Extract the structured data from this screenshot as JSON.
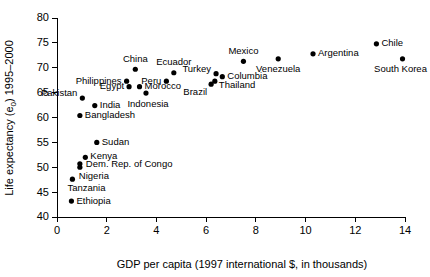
{
  "chart_data": {
    "type": "scatter",
    "title": "",
    "xlabel": "GDP per capita (1997 international $, in thousands)",
    "ylabel": "Life expectancy (e0) 1995–2000",
    "ylabel_main": "Life expectancy (e",
    "ylabel_sub": "0",
    "ylabel_tail": ") 1995–2000",
    "xlim": [
      0,
      14
    ],
    "ylim": [
      40,
      80
    ],
    "xticks": [
      0,
      2,
      4,
      6,
      8,
      10,
      12,
      14
    ],
    "yticks": [
      40,
      45,
      50,
      55,
      60,
      65,
      70,
      75,
      80
    ],
    "grid": false,
    "legend": "none",
    "marker_color": "#000000",
    "axis_color": "#000000",
    "background": "#ffffff",
    "points": [
      {
        "label": "Ethiopia",
        "x": 0.58,
        "y": 43.2,
        "lx": "start",
        "dx": 5,
        "dy": 0
      },
      {
        "label": "Tanzania",
        "x": 0.62,
        "y": 47.6,
        "lx": "start",
        "dx": -5,
        "dy": 9
      },
      {
        "label": "Nigeria",
        "x": 0.92,
        "y": 50.0,
        "lx": "start",
        "dx": -1,
        "dy": 9
      },
      {
        "label": "Dem. Rep. of Congo",
        "x": 0.92,
        "y": 50.7,
        "lx": "start",
        "dx": 6,
        "dy": 1
      },
      {
        "label": "Kenya",
        "x": 1.14,
        "y": 52.0,
        "lx": "start",
        "dx": 5,
        "dy": -0.5
      },
      {
        "label": "Sudan",
        "x": 1.6,
        "y": 55.0,
        "lx": "start",
        "dx": 5,
        "dy": 0
      },
      {
        "label": "Bangladesh",
        "x": 0.92,
        "y": 60.4,
        "lx": "start",
        "dx": 5,
        "dy": 0
      },
      {
        "label": "India",
        "x": 1.52,
        "y": 62.4,
        "lx": "start",
        "dx": 5,
        "dy": 0
      },
      {
        "label": "Pakistan",
        "x": 1.02,
        "y": 63.9,
        "lx": "end",
        "dx": -5,
        "dy": -5
      },
      {
        "label": "Egypt",
        "x": 2.9,
        "y": 66.2,
        "lx": "end",
        "dx": -5,
        "dy": 0
      },
      {
        "label": "Philippines",
        "x": 2.8,
        "y": 67.3,
        "lx": "end",
        "dx": -5,
        "dy": 0
      },
      {
        "label": "China",
        "x": 3.15,
        "y": 69.7,
        "lx": "middle",
        "dx": 0,
        "dy": -10
      },
      {
        "label": "Morocco",
        "x": 3.32,
        "y": 66.2,
        "lx": "start",
        "dx": 5,
        "dy": 0
      },
      {
        "label": "Indonesia",
        "x": 3.58,
        "y": 64.9,
        "lx": "middle",
        "dx": 2,
        "dy": 11
      },
      {
        "label": "Peru",
        "x": 4.4,
        "y": 67.3,
        "lx": "end",
        "dx": -5,
        "dy": 0
      },
      {
        "label": "Ecuador",
        "x": 4.7,
        "y": 69.0,
        "lx": "middle",
        "dx": 0,
        "dy": -10
      },
      {
        "label": "Brazil",
        "x": 6.2,
        "y": 66.7,
        "lx": "end",
        "dx": -4,
        "dy": 8
      },
      {
        "label": "Thailand",
        "x": 6.35,
        "y": 67.3,
        "lx": "start",
        "dx": 4,
        "dy": 4
      },
      {
        "label": "Turkey",
        "x": 6.4,
        "y": 68.8,
        "lx": "end",
        "dx": -5,
        "dy": -4
      },
      {
        "label": "Columbia",
        "x": 6.65,
        "y": 68.2,
        "lx": "start",
        "dx": 5,
        "dy": 0
      },
      {
        "label": "Mexico",
        "x": 7.5,
        "y": 71.3,
        "lx": "middle",
        "dx": 0,
        "dy": -10
      },
      {
        "label": "Venezuela",
        "x": 8.9,
        "y": 71.8,
        "lx": "middle",
        "dx": 0,
        "dy": 11
      },
      {
        "label": "Argentina",
        "x": 10.3,
        "y": 72.8,
        "lx": "start",
        "dx": 5,
        "dy": 0
      },
      {
        "label": "Chile",
        "x": 12.85,
        "y": 74.8,
        "lx": "start",
        "dx": 5,
        "dy": 0
      },
      {
        "label": "South Korea",
        "x": 13.9,
        "y": 71.8,
        "lx": "middle",
        "dx": -2,
        "dy": 11
      }
    ]
  }
}
